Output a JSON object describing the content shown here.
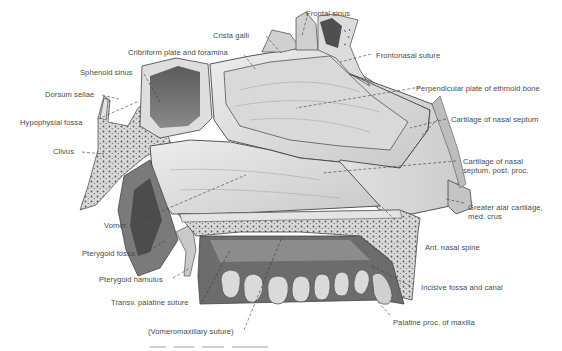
{
  "figure": {
    "caption_visible": false
  },
  "labels": {
    "frontal_sinus": "Frontal sinus",
    "crista_galli": "Crista galli",
    "cribriform_plate": "Cribriform plate and foramina",
    "frontonasal_suture": "Frontonasal suture",
    "sphenoid_sinus": "Sphenoid sinus",
    "perpendicular_plate": "Perpendicular plate of ethmoid bone",
    "dorsum_sellae": "Dorsum sellae",
    "hypophysial_fossa": "Hypophysial fossa",
    "cartilage_septum": "Cartilage of nasal septum",
    "clivus": "Clivus",
    "cartilage_septum_post_1": "Cartilage of nasal",
    "cartilage_septum_post_2": "septum, post. proc.",
    "vomer": "Vomer",
    "greater_alar_1": "Greater alar cartilage,",
    "greater_alar_2": "med. crus",
    "ant_nasal_spine": "Ant. nasal spine",
    "pterygoid_fossa": "Pterygoid fossa",
    "pterygoid_hamulus": "Pterygoid hamulus",
    "incisive_fossa": "Incisive fossa and canal",
    "transv_palatine": "Transv. palatine suture",
    "vomeromaxillary": "(Vomeromaxillary suture)",
    "palatine_proc": "Palatine proc. of maxilla"
  },
  "colors": {
    "label_text": "#4a4a4a",
    "leader_line": "#3a3a3a",
    "bone_light": "#e6e6e6",
    "bone_mid": "#bdbdbd",
    "bone_dark": "#6e6e6e",
    "cavity": "#4a4a4a"
  }
}
